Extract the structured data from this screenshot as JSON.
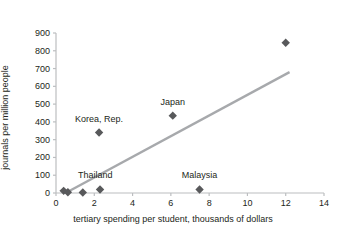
{
  "chart_data": {
    "type": "scatter",
    "title": "",
    "xlabel": "tertiary spending per student, thousands of dollars",
    "ylabel": "journals per million people",
    "xlim": [
      0,
      14
    ],
    "ylim": [
      0,
      900
    ],
    "xticks": [
      "0",
      "2",
      "4",
      "6",
      "8",
      "10",
      "12",
      "14"
    ],
    "xtick_values": [
      0,
      2,
      4,
      6,
      8,
      10,
      12,
      14
    ],
    "yticks": [
      "0",
      "100",
      "200",
      "300",
      "400",
      "500",
      "600",
      "700",
      "800",
      "900"
    ],
    "ytick_values": [
      0,
      100,
      200,
      300,
      400,
      500,
      600,
      700,
      800,
      900
    ],
    "grid": false,
    "legend": "none",
    "marker": "diamond",
    "marker_color": "#58595b",
    "axis_color": "#bcbec0",
    "trendline": {
      "color": "#a7a9ac",
      "x_start": 0.5,
      "y_start": 0,
      "x_end": 12.2,
      "y_end": 680
    },
    "points": [
      {
        "label": "",
        "x": 0.4,
        "y": 12
      },
      {
        "label": "",
        "x": 0.62,
        "y": 4
      },
      {
        "label": "",
        "x": 1.4,
        "y": 3
      },
      {
        "label": "Thailand",
        "x": 2.3,
        "y": 20
      },
      {
        "label": "Korea, Rep.",
        "x": 2.25,
        "y": 340
      },
      {
        "label": "Japan",
        "x": 6.1,
        "y": 435
      },
      {
        "label": "Malaysia",
        "x": 7.5,
        "y": 20
      },
      {
        "label": "",
        "x": 12.0,
        "y": 845
      }
    ],
    "point_labels": [
      {
        "text": "Korea, Rep.",
        "x": 2.25,
        "y": 410
      },
      {
        "text": "Japan",
        "x": 6.1,
        "y": 505
      },
      {
        "text": "Thailand",
        "x": 2.05,
        "y": 95
      },
      {
        "text": "Malaysia",
        "x": 7.5,
        "y": 95
      }
    ]
  }
}
